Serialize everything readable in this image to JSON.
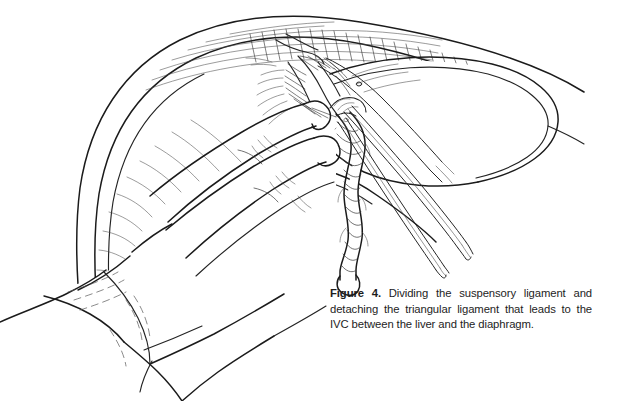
{
  "figure": {
    "number_label": "Figure 4.",
    "caption_text": " Dividing the suspensory ligament and detaching the triangular ligament that leads to the IVC between the liver and the diaphragm.",
    "caption_full": "Figure 4. Dividing the suspensory ligament and detaching the triangular ligament that leads to the IVC between the liver and the diaphragm.",
    "caption_lines": [
      "Figure 4. Dividing the suspensory ligament and",
      "detaching the triangular ligament that leads to",
      "the IVC between the liver and the diaphragm."
    ]
  },
  "illustration": {
    "type": "line-art surgical illustration",
    "subject": "Dividing the suspensory ligament of the liver with scissors while a gloved hand retracts the liver from the diaphragm",
    "structures": [
      {
        "name": "diaphragm",
        "description": "large domed muscular sheet arcing across the upper portion with radiating fibrous striations"
      },
      {
        "name": "liver",
        "description": "smooth lobe occupying the right of frame, retracted downward"
      },
      {
        "name": "suspensory-ligament",
        "description": "divided twisted fibrous cord hanging vertically at center with rounded cut end"
      },
      {
        "name": "triangular-ligament",
        "description": "fibrous attachment at the dissection site, heavily cross-hatched"
      },
      {
        "name": "surgeons-hand",
        "description": "gloved left hand with extended index and middle fingers retracting the liver, entering from lower left"
      },
      {
        "name": "scissors",
        "description": "long slender surgical scissors with two blades directed from upper center toward lower right"
      }
    ],
    "colors": {
      "background": "#ffffff",
      "ink": "#1b1b1b",
      "hatching": "#4a4a4a",
      "caption_text": "#1d1d1d"
    }
  }
}
